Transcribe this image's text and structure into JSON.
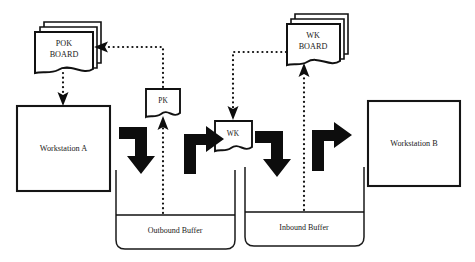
{
  "diagram": {
    "canvas": {
      "width": 475,
      "height": 262
    },
    "colors": {
      "background": "#ffffff",
      "stroke": "#111111",
      "arrow_fill": "#0d0d0d",
      "text": "#1a1a1a"
    },
    "nodes": {
      "pok_board": {
        "line1": "POK",
        "line2": "BOARD"
      },
      "wk_board": {
        "line1": "WK",
        "line2": "BOARD"
      },
      "pk_card": {
        "label": "PK"
      },
      "wk_card": {
        "label": "WK"
      },
      "workstation_a": {
        "label": "Workstation A"
      },
      "workstation_b": {
        "label": "Workstation B"
      },
      "outbound_buffer": {
        "label": "Outbound Buffer"
      },
      "inbound_buffer": {
        "label": "Inbound Buffer"
      }
    },
    "edges": [
      {
        "name": "pk-to-pok-board",
        "style": "dotted",
        "from": "pk_card",
        "to": "pok_board"
      },
      {
        "name": "pok-board-to-workstation-a",
        "style": "dotted",
        "from": "pok_board",
        "to": "workstation_a"
      },
      {
        "name": "outbound-buffer-to-pk",
        "style": "dotted",
        "from": "outbound_buffer",
        "to": "pk_card"
      },
      {
        "name": "wk-board-to-wk",
        "style": "dotted",
        "from": "wk_board",
        "to": "wk_card"
      },
      {
        "name": "inbound-buffer-to-wk-board",
        "style": "dotted",
        "from": "inbound_buffer",
        "to": "wk_board"
      },
      {
        "name": "workstation-a-to-outbound-buffer",
        "style": "solid-elbow",
        "from": "workstation_a",
        "to": "outbound_buffer"
      },
      {
        "name": "outbound-buffer-to-wk",
        "style": "solid-elbow",
        "from": "outbound_buffer",
        "to": "wk_card"
      },
      {
        "name": "wk-to-inbound-buffer",
        "style": "solid-elbow",
        "from": "wk_card",
        "to": "inbound_buffer"
      },
      {
        "name": "inbound-buffer-to-workstation-b",
        "style": "solid-elbow",
        "from": "inbound_buffer",
        "to": "workstation_b"
      }
    ]
  }
}
